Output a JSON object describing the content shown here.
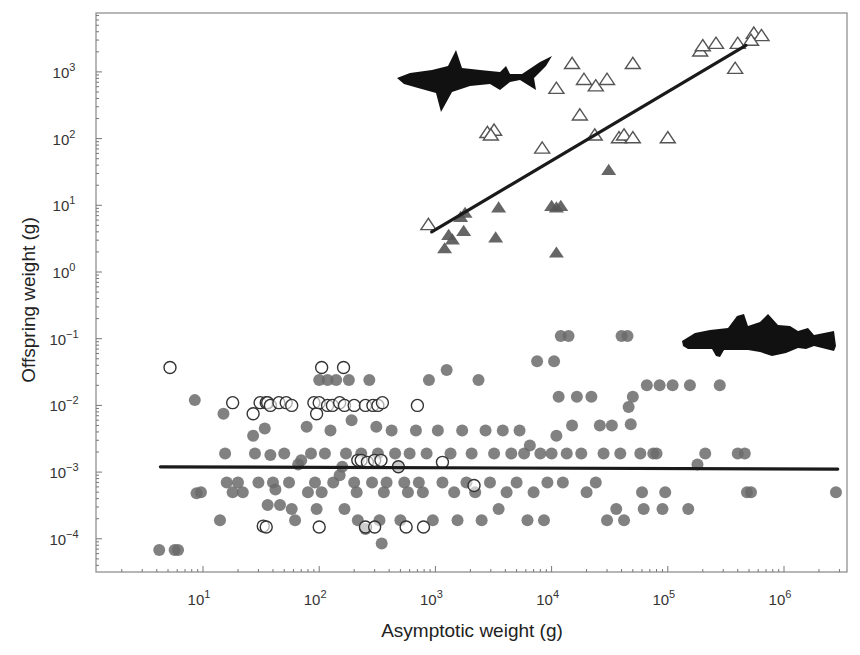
{
  "chart_data": {
    "type": "scatter",
    "title": "",
    "xlabel": "Asymptotic weight (g)",
    "ylabel": "Offspring weight (g)",
    "xscale": "log",
    "yscale": "log",
    "xlim": [
      1.3,
      3500000
    ],
    "ylim": [
      3e-05,
      8000
    ],
    "grid": false,
    "legend": null,
    "x_ticks": [
      {
        "exp": "1",
        "value": 10
      },
      {
        "exp": "2",
        "value": 100
      },
      {
        "exp": "3",
        "value": 1000
      },
      {
        "exp": "4",
        "value": 10000
      },
      {
        "exp": "5",
        "value": 100000
      },
      {
        "exp": "6",
        "value": 1000000
      }
    ],
    "y_ticks": [
      {
        "exp": "3",
        "value": 1000
      },
      {
        "exp": "2",
        "value": 100
      },
      {
        "exp": "1",
        "value": 10
      },
      {
        "exp": "0",
        "value": 1
      },
      {
        "exp": "−1",
        "value": 0.1
      },
      {
        "exp": "−2",
        "value": 0.01
      },
      {
        "exp": "−3",
        "value": 0.001
      },
      {
        "exp": "−4",
        "value": 0.0001
      }
    ],
    "annotations": [
      {
        "type": "silhouette",
        "name": "shark",
        "position": "upper-middle"
      },
      {
        "type": "silhouette",
        "name": "cod",
        "position": "middle-right"
      }
    ],
    "series": [
      {
        "name": "Elasmobranchs (open triangles)",
        "marker": "triangle-open",
        "color": "#555555",
        "points": [
          [
            870,
            5
          ],
          [
            2800,
            120
          ],
          [
            3200,
            130
          ],
          [
            3000,
            110
          ],
          [
            8300,
            70
          ],
          [
            11000,
            550
          ],
          [
            15000,
            1300
          ],
          [
            17500,
            220
          ],
          [
            19000,
            750
          ],
          [
            24000,
            600
          ],
          [
            23500,
            110
          ],
          [
            30000,
            750
          ],
          [
            38000,
            100
          ],
          [
            42000,
            110
          ],
          [
            50000,
            100
          ],
          [
            50000,
            1300
          ],
          [
            100000,
            100
          ],
          [
            190000,
            2000
          ],
          [
            200000,
            2400
          ],
          [
            260000,
            2600
          ],
          [
            380000,
            1100
          ],
          [
            400000,
            2600
          ],
          [
            550000,
            3700
          ],
          [
            640000,
            3400
          ],
          [
            520000,
            2900
          ]
        ]
      },
      {
        "name": "Elasmobranchs (filled triangles)",
        "marker": "triangle-filled",
        "color": "#555555",
        "points": [
          [
            1200,
            2.2
          ],
          [
            1400,
            3.0
          ],
          [
            1300,
            3.5
          ],
          [
            1650,
            6.5
          ],
          [
            1800,
            7.5
          ],
          [
            1750,
            4.0
          ],
          [
            3500,
            9.0
          ],
          [
            3300,
            3.2
          ],
          [
            10000,
            9.5
          ],
          [
            11000,
            9.0
          ],
          [
            12000,
            9.5
          ],
          [
            11000,
            1.9
          ],
          [
            31000,
            33
          ]
        ]
      },
      {
        "name": "Teleosts (filled circles)",
        "marker": "circle-filled",
        "color": "#6b6b6b",
        "points": [
          [
            4.2,
            6.8e-05
          ],
          [
            5.7,
            6.8e-05
          ],
          [
            6.1,
            6.8e-05
          ],
          [
            8.5,
            0.012
          ],
          [
            8.8,
            0.00048
          ],
          [
            9.6,
            0.0005
          ],
          [
            15,
            0.0075
          ],
          [
            14,
            0.00019
          ],
          [
            15.5,
            0.0019
          ],
          [
            16,
            0.0007
          ],
          [
            18,
            0.0005
          ],
          [
            20,
            0.0007
          ],
          [
            22,
            0.0005
          ],
          [
            27,
            0.0035
          ],
          [
            28,
            0.0019
          ],
          [
            30,
            0.0007
          ],
          [
            34,
            0.0045
          ],
          [
            36,
            0.00032
          ],
          [
            38,
            0.0018
          ],
          [
            40,
            0.0007
          ],
          [
            42,
            0.00055
          ],
          [
            46,
            0.00032
          ],
          [
            50,
            0.0019
          ],
          [
            55,
            0.0007
          ],
          [
            58,
            0.00028
          ],
          [
            62,
            0.00019
          ],
          [
            66,
            0.0013
          ],
          [
            70,
            0.0015
          ],
          [
            78,
            0.0048
          ],
          [
            80,
            0.0005
          ],
          [
            85,
            0.0019
          ],
          [
            92,
            0.0007
          ],
          [
            95,
            0.00028
          ],
          [
            100,
            0.024
          ],
          [
            105,
            0.0005
          ],
          [
            112,
            0.0019
          ],
          [
            118,
            0.024
          ],
          [
            125,
            0.0042
          ],
          [
            132,
            0.0007
          ],
          [
            140,
            0.024
          ],
          [
            150,
            0.0009
          ],
          [
            158,
            0.0012
          ],
          [
            165,
            0.00028
          ],
          [
            170,
            0.0019
          ],
          [
            180,
            0.024
          ],
          [
            190,
            0.006
          ],
          [
            200,
            0.0007
          ],
          [
            210,
            0.0005
          ],
          [
            215,
            0.00019
          ],
          [
            230,
            0.0019
          ],
          [
            250,
            0.00014
          ],
          [
            270,
            0.024
          ],
          [
            285,
            0.0007
          ],
          [
            310,
            0.0048
          ],
          [
            320,
            0.0019
          ],
          [
            330,
            0.00019
          ],
          [
            345,
            8.5e-05
          ],
          [
            360,
            0.0005
          ],
          [
            380,
            0.0007
          ],
          [
            420,
            0.0042
          ],
          [
            450,
            0.0019
          ],
          [
            480,
            0.0012
          ],
          [
            500,
            0.00019
          ],
          [
            540,
            0.0007
          ],
          [
            580,
            0.0005
          ],
          [
            600,
            0.0019
          ],
          [
            680,
            0.0042
          ],
          [
            720,
            0.0007
          ],
          [
            780,
            0.0005
          ],
          [
            840,
            0.0019
          ],
          [
            880,
            0.024
          ],
          [
            950,
            0.00019
          ],
          [
            1050,
            0.0042
          ],
          [
            1150,
            0.0007
          ],
          [
            1250,
            0.034
          ],
          [
            1350,
            0.0019
          ],
          [
            1450,
            0.0005
          ],
          [
            1550,
            0.00019
          ],
          [
            1700,
            0.0042
          ],
          [
            1850,
            0.0007
          ],
          [
            2050,
            0.0019
          ],
          [
            2200,
            0.0005
          ],
          [
            2350,
            0.024
          ],
          [
            2500,
            0.00019
          ],
          [
            2700,
            0.0042
          ],
          [
            2950,
            0.0007
          ],
          [
            3200,
            0.0019
          ],
          [
            3500,
            0.00028
          ],
          [
            3800,
            0.0042
          ],
          [
            4100,
            0.0005
          ],
          [
            4500,
            0.0019
          ],
          [
            5000,
            0.0007
          ],
          [
            5300,
            0.0042
          ],
          [
            5800,
            0.0019
          ],
          [
            6200,
            0.00019
          ],
          [
            6500,
            0.0025
          ],
          [
            7000,
            0.0005
          ],
          [
            7500,
            0.046
          ],
          [
            8000,
            0.0019
          ],
          [
            8600,
            0.00019
          ],
          [
            9200,
            0.0007
          ],
          [
            10000,
            0.0019
          ],
          [
            10500,
            0.046
          ],
          [
            11000,
            0.0035
          ],
          [
            11500,
            0.0135
          ],
          [
            12000,
            0.11
          ],
          [
            12500,
            0.0007
          ],
          [
            13500,
            0.0019
          ],
          [
            14000,
            0.11
          ],
          [
            15000,
            0.005
          ],
          [
            16500,
            0.0135
          ],
          [
            18000,
            0.0019
          ],
          [
            20000,
            0.0005
          ],
          [
            22000,
            0.0135
          ],
          [
            24000,
            0.0007
          ],
          [
            26000,
            0.005
          ],
          [
            28000,
            0.0019
          ],
          [
            30000,
            0.00019
          ],
          [
            33000,
            0.005
          ],
          [
            36000,
            0.00028
          ],
          [
            39000,
            0.0019
          ],
          [
            40000,
            0.11
          ],
          [
            42000,
            0.00019
          ],
          [
            45000,
            0.11
          ],
          [
            46000,
            0.0095
          ],
          [
            48000,
            0.0052
          ],
          [
            50000,
            0.0135
          ],
          [
            58000,
            0.0019
          ],
          [
            60000,
            0.0005
          ],
          [
            62000,
            0.00028
          ],
          [
            66000,
            0.02
          ],
          [
            75000,
            0.0019
          ],
          [
            80000,
            0.0019
          ],
          [
            85000,
            0.02
          ],
          [
            90000,
            0.00028
          ],
          [
            95000,
            0.0005
          ],
          [
            110000,
            0.02
          ],
          [
            150000,
            0.00028
          ],
          [
            155000,
            0.02
          ],
          [
            180000,
            0.0013
          ],
          [
            210000,
            0.0019
          ],
          [
            280000,
            0.02
          ],
          [
            400000,
            0.0019
          ],
          [
            460000,
            0.0019
          ],
          [
            480000,
            0.0005
          ],
          [
            520000,
            0.0005
          ],
          [
            2800000,
            0.0005
          ]
        ]
      },
      {
        "name": "Teleosts (open circles)",
        "marker": "circle-open",
        "color": "#333333",
        "points": [
          [
            5.2,
            0.037
          ],
          [
            18,
            0.011
          ],
          [
            27,
            0.0075
          ],
          [
            31,
            0.011
          ],
          [
            35,
            0.011
          ],
          [
            36,
            0.011
          ],
          [
            38,
            0.01
          ],
          [
            45,
            0.011
          ],
          [
            52,
            0.011
          ],
          [
            58,
            0.01
          ],
          [
            90,
            0.011
          ],
          [
            95,
            0.0075
          ],
          [
            100,
            0.011
          ],
          [
            105,
            0.037
          ],
          [
            118,
            0.01
          ],
          [
            130,
            0.01
          ],
          [
            150,
            0.011
          ],
          [
            162,
            0.037
          ],
          [
            165,
            0.01
          ],
          [
            200,
            0.01
          ],
          [
            250,
            0.01
          ],
          [
            290,
            0.01
          ],
          [
            320,
            0.01
          ],
          [
            350,
            0.011
          ],
          [
            700,
            0.01
          ],
          [
            215,
            0.0015
          ],
          [
            230,
            0.0015
          ],
          [
            260,
            0.0014
          ],
          [
            300,
            0.0015
          ],
          [
            340,
            0.0015
          ],
          [
            480,
            0.0012
          ],
          [
            1150,
            0.0014
          ],
          [
            2150,
            0.00063
          ],
          [
            33,
            0.000155
          ],
          [
            35,
            0.00015
          ],
          [
            100,
            0.00015
          ],
          [
            250,
            0.00015
          ],
          [
            300,
            0.00015
          ],
          [
            560,
            0.00015
          ],
          [
            790,
            0.00015
          ]
        ]
      }
    ],
    "fit_lines": [
      {
        "name": "Elasmobranch regression",
        "x": [
          930,
          470000
        ],
        "y": [
          4.0,
          2500
        ],
        "color": "#1a1a1a"
      },
      {
        "name": "Teleost regression",
        "x": [
          4.3,
          2900000
        ],
        "y": [
          0.0012,
          0.00111
        ],
        "color": "#1a1a1a"
      }
    ]
  }
}
